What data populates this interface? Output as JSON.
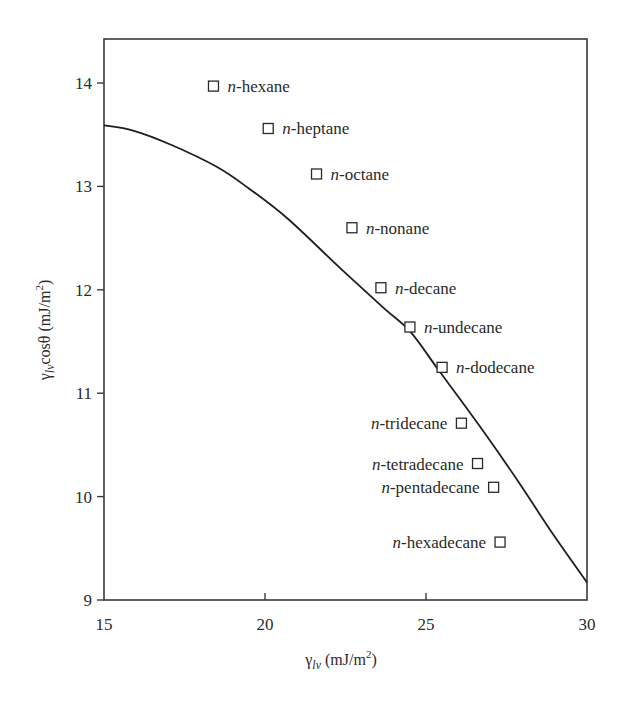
{
  "chart_data": {
    "type": "scatter",
    "title": "",
    "xlabel": "γlv (mJ/m²)",
    "ylabel": "γlv cosθ (mJ/m²)",
    "xlim": [
      15,
      30
    ],
    "ylim": [
      9,
      14.4
    ],
    "xticks": [
      15,
      20,
      25,
      30
    ],
    "yticks": [
      9,
      10,
      11,
      12,
      13,
      14
    ],
    "grid": false,
    "legend": "none (points labeled directly)",
    "series": [
      {
        "name": "n-alkanes",
        "type": "scatter",
        "marker": "open-square",
        "points": [
          {
            "label": "n-hexane",
            "x": 18.4,
            "y": 13.97,
            "label_side": "right"
          },
          {
            "label": "n-heptane",
            "x": 20.1,
            "y": 13.56,
            "label_side": "right"
          },
          {
            "label": "n-octane",
            "x": 21.6,
            "y": 13.12,
            "label_side": "right"
          },
          {
            "label": "n-nonane",
            "x": 22.7,
            "y": 12.6,
            "label_side": "right"
          },
          {
            "label": "n-decane",
            "x": 23.6,
            "y": 12.02,
            "label_side": "right"
          },
          {
            "label": "n-undecane",
            "x": 24.5,
            "y": 11.64,
            "label_side": "right"
          },
          {
            "label": "n-dodecane",
            "x": 25.5,
            "y": 11.25,
            "label_side": "right"
          },
          {
            "label": "n-tridecane",
            "x": 26.1,
            "y": 10.71,
            "label_side": "left"
          },
          {
            "label": "n-tetradecane",
            "x": 26.6,
            "y": 10.32,
            "label_side": "left"
          },
          {
            "label": "n-pentadecane",
            "x": 27.1,
            "y": 10.09,
            "label_side": "left"
          },
          {
            "label": "n-hexadecane",
            "x": 27.3,
            "y": 9.56,
            "label_side": "left"
          }
        ]
      },
      {
        "name": "theoretical curve",
        "type": "line",
        "points": [
          {
            "x": 15.0,
            "y": 13.59
          },
          {
            "x": 15.9,
            "y": 13.54
          },
          {
            "x": 17.1,
            "y": 13.4
          },
          {
            "x": 18.5,
            "y": 13.19
          },
          {
            "x": 19.5,
            "y": 12.98
          },
          {
            "x": 20.7,
            "y": 12.69
          },
          {
            "x": 22.3,
            "y": 12.22
          },
          {
            "x": 23.7,
            "y": 11.82
          },
          {
            "x": 24.5,
            "y": 11.6
          },
          {
            "x": 25.4,
            "y": 11.22
          },
          {
            "x": 26.65,
            "y": 10.69
          },
          {
            "x": 27.9,
            "y": 10.13
          },
          {
            "x": 28.85,
            "y": 9.68
          },
          {
            "x": 30.0,
            "y": 9.17
          }
        ]
      }
    ]
  },
  "axes": {
    "x_label_main": "γ",
    "x_label_sub": "lv",
    "x_label_unit": " (mJ/m",
    "x_label_sup": "2",
    "x_label_close": ")",
    "y_label_main": "γ",
    "y_label_sub": "lv",
    "y_label_rest": "cosθ (mJ/m",
    "y_label_sup": "2",
    "y_label_close": ")"
  },
  "colors": {
    "frame": "#3a3a3a",
    "curve": "#1e1e1e",
    "marker": "#2a2a2a",
    "text": "#2a2a2a",
    "background": "#ffffff"
  }
}
